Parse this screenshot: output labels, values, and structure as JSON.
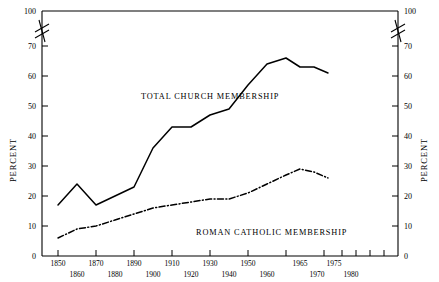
{
  "chart_data": {
    "type": "line",
    "title": "",
    "xlabel": "",
    "ylabel": "PERCENT",
    "ylabel_right": "PERCENT",
    "ylim": [
      0,
      100
    ],
    "y_axis_break": {
      "from": 70,
      "to": 100,
      "present": true
    },
    "grid": false,
    "legend_position": "inline-annotations",
    "y_ticks": [
      0,
      10,
      20,
      30,
      40,
      50,
      60,
      70,
      100
    ],
    "x_ticks": [
      1850,
      1860,
      1870,
      1880,
      1890,
      1900,
      1910,
      1920,
      1930,
      1940,
      1950,
      1960,
      1965,
      1970,
      1975,
      1980
    ],
    "x_tick_rows": [
      "top",
      "bottom",
      "top",
      "bottom",
      "top",
      "bottom",
      "top",
      "bottom",
      "top",
      "bottom",
      "top",
      "bottom",
      "top",
      "bottom",
      "top",
      "bottom"
    ],
    "series": [
      {
        "name": "TOTAL CHURCH MEMBERSHIP",
        "style": "solid",
        "x": [
          1850,
          1860,
          1870,
          1880,
          1890,
          1900,
          1910,
          1920,
          1930,
          1940,
          1950,
          1960,
          1965,
          1970,
          1975,
          1980
        ],
        "values": [
          17,
          24,
          17,
          20,
          23,
          36,
          43,
          43,
          47,
          49,
          57,
          64,
          66,
          63,
          63,
          61
        ]
      },
      {
        "name": "ROMAN CATHOLIC MEMBERSHIP",
        "style": "dash-dot",
        "x": [
          1850,
          1860,
          1870,
          1880,
          1890,
          1900,
          1910,
          1920,
          1930,
          1940,
          1950,
          1960,
          1965,
          1970,
          1975,
          1980
        ],
        "values": [
          6,
          9,
          10,
          12,
          14,
          16,
          17,
          18,
          19,
          19,
          21,
          24,
          27,
          29,
          28,
          26
        ]
      }
    ],
    "annotations": [
      {
        "text": "TOTAL CHURCH MEMBERSHIP",
        "x": 1898,
        "y": 52,
        "series": "TOTAL CHURCH MEMBERSHIP"
      },
      {
        "text": "ROMAN CATHOLIC MEMBERSHIP",
        "x": 1932,
        "y": 11,
        "series": "ROMAN CATHOLIC MEMBERSHIP"
      }
    ],
    "colors": {
      "line": "#000000",
      "background": "#ffffff",
      "axis": "#000000"
    }
  },
  "axis": {
    "left_title": "PERCENT",
    "right_title": "PERCENT",
    "y_labels": [
      "100",
      "70",
      "60",
      "50",
      "40",
      "30",
      "20",
      "10",
      "0"
    ],
    "y_labels_right": [
      "100",
      "70",
      "60",
      "50",
      "40",
      "30",
      "20",
      "10",
      "0"
    ],
    "x_labels_top_row": [
      "1850",
      "1870",
      "1890",
      "1910",
      "1930",
      "1950",
      "1965",
      "1975"
    ],
    "x_labels_bottom_row": [
      "1860",
      "1880",
      "1900",
      "1920",
      "1940",
      "1960",
      "1970",
      "1980"
    ]
  },
  "labels": {
    "total_church": "TOTAL CHURCH MEMBERSHIP",
    "roman_catholic": "ROMAN CATHOLIC MEMBERSHIP"
  }
}
